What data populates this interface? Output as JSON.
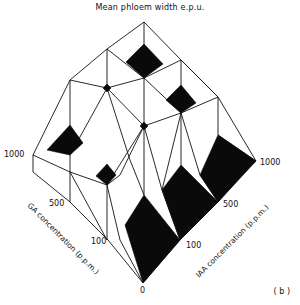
{
  "figure": {
    "title": "Mean phloem width e.p.u.",
    "panel_label": "( b )",
    "type": "3D block surface plot (isometric)",
    "colors": {
      "line": "#111111",
      "fill_dark": "#0a0a0a",
      "background": "#ffffff"
    }
  },
  "axes": {
    "ga": {
      "title": "GA concentration (p.p.m.)",
      "ticks": [
        "0",
        "100",
        "500",
        "1000"
      ]
    },
    "iaa": {
      "title": "IAA concentration (p.p.m.)",
      "ticks": [
        "0",
        "100",
        "500",
        "1000"
      ]
    },
    "origin_label": "0"
  },
  "tick_labels": {
    "ga_1000": "1000",
    "ga_500": "500",
    "ga_100": "100",
    "iaa_1000": "1000",
    "iaa_500": "500",
    "iaa_100": "100",
    "origin": "0"
  }
}
